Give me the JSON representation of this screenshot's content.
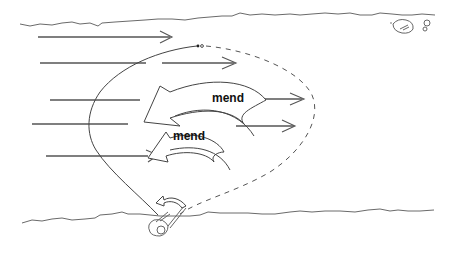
{
  "diagram": {
    "labels": {
      "mend_upper": "mend",
      "mend_lower": "mend"
    },
    "elements": {
      "far_bank": "wavy line across top",
      "near_bank": "wavy line across bottom",
      "current_arrows": 6,
      "fly_line_solid": "angler to fly, upstream portion",
      "fly_line_dashed": "downstream belly of line",
      "mend_arrows": 2,
      "angler_rod_arrow": "small curved arrow near angler",
      "rock": "rock near far bank, top right"
    },
    "colors": {
      "stroke": "#555555",
      "background": "#ffffff",
      "text": "#111111"
    }
  }
}
